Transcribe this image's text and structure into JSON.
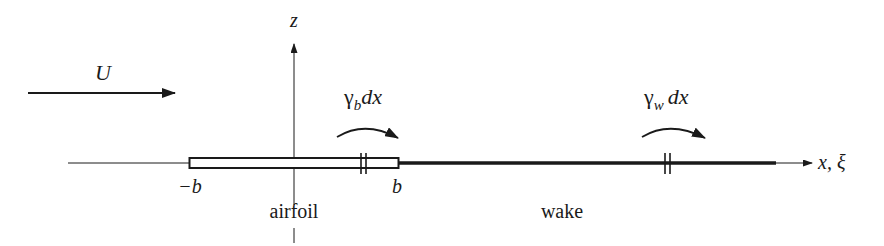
{
  "diagram": {
    "type": "airfoil-vortex-sheet-schematic",
    "colors": {
      "ink": "#1a1a1a",
      "background": "#ffffff"
    },
    "freestream": {
      "label": "U",
      "arrow_from_x": 28,
      "arrow_to_x": 175,
      "y": 93
    },
    "axes": {
      "vertical": {
        "label": "z",
        "x": 294
      },
      "horizontal": {
        "label": "x, ξ",
        "y": 163
      }
    },
    "airfoil": {
      "label": "airfoil",
      "left_label": "−b",
      "right_label": "b",
      "x_left": 189,
      "x_right": 399
    },
    "wake": {
      "label": "wake",
      "x_start": 399,
      "x_end": 776
    },
    "vortex_elements": [
      {
        "symbol": "γ",
        "subscript": "b",
        "suffix": "dx",
        "tick_x": 364
      },
      {
        "symbol": "γ",
        "subscript": "w",
        "suffix": "dx",
        "tick_x": 668
      }
    ]
  }
}
